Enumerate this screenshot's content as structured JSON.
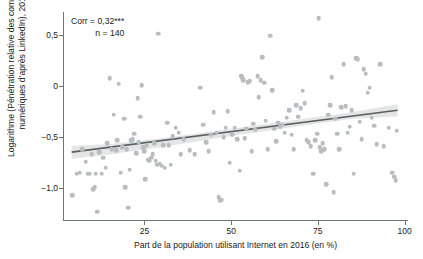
{
  "chart_data": {
    "type": "scatter",
    "title": "",
    "xlabel": "Part de la population utilisant Internet en 2016 (en %)",
    "ylabel_line1": "Logarithme (Pénétration relative des compétences",
    "ylabel_line2": "numériques d’après LinkedIn), 2018",
    "xlim": [
      1.5,
      101
    ],
    "ylim": [
      -1.32,
      0.72
    ],
    "xticks": [
      25,
      50,
      75,
      100
    ],
    "xticklabels": [
      "25",
      "50",
      "75",
      "100"
    ],
    "yticks": [
      0.5,
      0,
      -0.5,
      -1.0
    ],
    "yticklabels": [
      "0,5",
      "0",
      "−0,5",
      "−1,0"
    ],
    "grid": false,
    "legend": "none",
    "point_color": "#b9bdbe",
    "line_color": "#5a5f61",
    "band_color": "#e3e5e5",
    "axis_color": "#6f7476",
    "annotation": {
      "corr_label": "Corr = 0,32***",
      "n_label": "n = 140",
      "corr_value": 0.32,
      "significance": "***",
      "n": 140
    },
    "fit_line": {
      "x": [
        4,
        98
      ],
      "y": [
        -0.648,
        -0.239
      ]
    },
    "confidence_band": {
      "x": [
        4,
        15,
        30,
        50,
        70,
        85,
        98
      ],
      "upper": [
        -0.585,
        -0.568,
        -0.513,
        -0.419,
        -0.326,
        -0.255,
        -0.18
      ],
      "lower": [
        -0.712,
        -0.672,
        -0.597,
        -0.49,
        -0.392,
        -0.321,
        -0.3
      ]
    },
    "points": [
      [
        4.1,
        -1.07
      ],
      [
        5.4,
        -0.86
      ],
      [
        6.3,
        -0.85
      ],
      [
        7.1,
        -0.62
      ],
      [
        8.0,
        -0.74
      ],
      [
        8.6,
        -0.86
      ],
      [
        9.2,
        -0.86
      ],
      [
        9.8,
        -0.67
      ],
      [
        10.2,
        -1.01
      ],
      [
        10.6,
        -0.99
      ],
      [
        10.9,
        -0.86
      ],
      [
        11.4,
        -1.23
      ],
      [
        12.0,
        -0.65
      ],
      [
        12.6,
        -0.86
      ],
      [
        13.1,
        -0.7
      ],
      [
        13.8,
        -0.8
      ],
      [
        14.3,
        -0.56
      ],
      [
        15.0,
        0.075
      ],
      [
        15.6,
        -0.62
      ],
      [
        16.1,
        -0.28
      ],
      [
        16.8,
        -0.63
      ],
      [
        17.2,
        -0.53
      ],
      [
        17.6,
        0.02
      ],
      [
        18.1,
        -0.85
      ],
      [
        18.6,
        -0.6
      ],
      [
        19.1,
        -0.32
      ],
      [
        19.4,
        -0.99
      ],
      [
        19.9,
        -0.62
      ],
      [
        20.3,
        -1.19
      ],
      [
        20.8,
        -0.82
      ],
      [
        21.2,
        -0.53
      ],
      [
        21.6,
        -0.52
      ],
      [
        22.1,
        -0.47
      ],
      [
        22.6,
        -0.66
      ],
      [
        23.0,
        -0.12
      ],
      [
        23.4,
        -0.55
      ],
      [
        23.8,
        -0.3
      ],
      [
        24.2,
        0.005
      ],
      [
        24.6,
        -0.6
      ],
      [
        24.9,
        -0.64
      ],
      [
        25.2,
        -0.91
      ],
      [
        25.6,
        -0.58
      ],
      [
        26.0,
        -0.72
      ],
      [
        26.4,
        -0.73
      ],
      [
        26.9,
        -0.7
      ],
      [
        27.3,
        -0.67
      ],
      [
        27.8,
        -0.56
      ],
      [
        28.2,
        -0.73
      ],
      [
        28.6,
        -0.77
      ],
      [
        29.0,
        0.51
      ],
      [
        29.4,
        -0.76
      ],
      [
        29.9,
        -0.78
      ],
      [
        30.4,
        -0.58
      ],
      [
        30.9,
        -0.8
      ],
      [
        31.5,
        -0.36
      ],
      [
        32.0,
        -0.58
      ],
      [
        32.6,
        -0.77
      ],
      [
        33.2,
        -0.49
      ],
      [
        34.0,
        -0.41
      ],
      [
        34.8,
        -0.46
      ],
      [
        35.5,
        -0.67
      ],
      [
        36.3,
        -0.52
      ],
      [
        38.0,
        -0.63
      ],
      [
        39.5,
        -0.67
      ],
      [
        41.0,
        -0.02
      ],
      [
        42.0,
        -0.38
      ],
      [
        42.8,
        -0.55
      ],
      [
        43.5,
        -0.64
      ],
      [
        44.3,
        -0.48
      ],
      [
        45.0,
        -0.26
      ],
      [
        45.8,
        -0.46
      ],
      [
        46.4,
        -1.09
      ],
      [
        46.9,
        -1.12
      ],
      [
        47.3,
        -1.11
      ],
      [
        47.8,
        -0.5
      ],
      [
        48.4,
        -0.41
      ],
      [
        49.0,
        -0.25
      ],
      [
        49.6,
        -0.75
      ],
      [
        50.3,
        -0.48
      ],
      [
        51.0,
        -0.41
      ],
      [
        51.8,
        -0.52
      ],
      [
        52.4,
        -0.83
      ],
      [
        52.9,
        0.1
      ],
      [
        53.2,
        0.08
      ],
      [
        53.5,
        0.055
      ],
      [
        53.9,
        -0.51
      ],
      [
        54.3,
        -0.42
      ],
      [
        54.8,
        0.035
      ],
      [
        55.3,
        0.045
      ],
      [
        55.9,
        -0.64
      ],
      [
        56.4,
        -0.37
      ],
      [
        57.0,
        -0.43
      ],
      [
        57.6,
        0.095
      ],
      [
        58.0,
        -0.11
      ],
      [
        58.5,
        0.055
      ],
      [
        59.0,
        0.28
      ],
      [
        59.5,
        0.03
      ],
      [
        60.0,
        -0.34
      ],
      [
        60.6,
        -0.62
      ],
      [
        61.2,
        0.49
      ],
      [
        61.8,
        -0.045
      ],
      [
        62.4,
        -0.42
      ],
      [
        63.0,
        -0.54
      ],
      [
        63.6,
        -0.36
      ],
      [
        64.2,
        -0.4
      ],
      [
        64.8,
        -0.38
      ],
      [
        65.4,
        -0.46
      ],
      [
        66.0,
        -0.31
      ],
      [
        66.7,
        -0.24
      ],
      [
        67.4,
        -0.48
      ],
      [
        68.0,
        -0.62
      ],
      [
        68.7,
        -0.19
      ],
      [
        69.4,
        -0.3
      ],
      [
        70.0,
        -0.22
      ],
      [
        70.6,
        -0.05
      ],
      [
        71.2,
        -0.17
      ],
      [
        71.8,
        -0.53
      ],
      [
        72.4,
        -0.55
      ],
      [
        73.0,
        -0.59
      ],
      [
        73.6,
        -0.86
      ],
      [
        74.2,
        -0.53
      ],
      [
        74.8,
        -0.47
      ],
      [
        75.2,
        0.66
      ],
      [
        75.6,
        -0.6
      ],
      [
        76.0,
        -0.64
      ],
      [
        76.4,
        -0.56
      ],
      [
        76.9,
        -0.62
      ],
      [
        77.4,
        -0.96
      ],
      [
        78.0,
        -0.28
      ],
      [
        78.6,
        -0.19
      ],
      [
        79.0,
        0.085
      ],
      [
        79.5,
        -1.04
      ],
      [
        80.0,
        -0.32
      ],
      [
        80.6,
        -0.47
      ],
      [
        81.2,
        -0.62
      ],
      [
        81.8,
        -0.21
      ],
      [
        82.4,
        0.21
      ],
      [
        83.0,
        -0.2
      ],
      [
        83.6,
        -0.46
      ],
      [
        84.2,
        -0.4
      ],
      [
        84.8,
        -0.24
      ],
      [
        85.4,
        -0.86
      ],
      [
        86.0,
        0.27
      ],
      [
        86.5,
        0.26
      ],
      [
        87.0,
        -0.35
      ],
      [
        87.6,
        -0.52
      ],
      [
        88.2,
        0.16
      ],
      [
        88.8,
        0.12
      ],
      [
        89.4,
        -0.07
      ],
      [
        90.0,
        -0.02
      ],
      [
        90.6,
        -0.31
      ],
      [
        91.2,
        -0.39
      ],
      [
        92.0,
        -0.57
      ],
      [
        93.0,
        0.21
      ],
      [
        94.0,
        -0.59
      ],
      [
        95.5,
        -0.41
      ],
      [
        96.5,
        -0.85
      ],
      [
        97.0,
        -0.89
      ],
      [
        97.4,
        -0.92
      ],
      [
        97.8,
        -0.44
      ]
    ]
  }
}
